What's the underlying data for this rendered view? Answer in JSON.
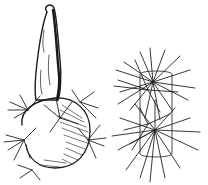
{
  "illustration": {
    "subject": "cactus plant with spine cluster detail",
    "style": "black ink line drawing on white",
    "colors": {
      "ink": "#1a1a1a",
      "background": "#ffffff"
    },
    "parts": [
      {
        "name": "elongated stem segment",
        "position": "upper left"
      },
      {
        "name": "round spiny base body",
        "position": "lower left"
      },
      {
        "name": "areole spine clusters detail",
        "position": "right"
      }
    ]
  }
}
